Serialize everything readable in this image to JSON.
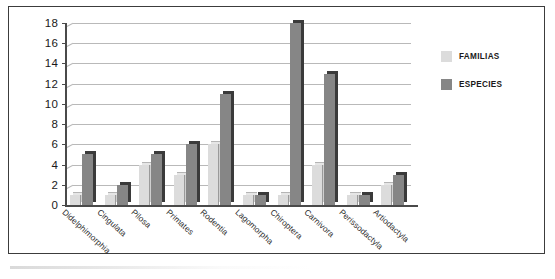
{
  "chart_data": {
    "type": "bar",
    "title": "",
    "xlabel": "",
    "ylabel": "",
    "ylim": [
      0,
      18
    ],
    "ytick_step": 2,
    "yticks": [
      0,
      2,
      4,
      6,
      8,
      10,
      12,
      14,
      16,
      18
    ],
    "grid": true,
    "legend_position": "right",
    "categories": [
      "Didelphimorphia",
      "Cingulata",
      "Pilosa",
      "Primates",
      "Rodentia",
      "Lagomorpha",
      "Chiroptera",
      "Carnivora",
      "Perissodactyla",
      "Artiodactyla"
    ],
    "series": [
      {
        "name": "FAMILIAS",
        "color": "#dcdcdc",
        "values": [
          1,
          1,
          4,
          3,
          6,
          1,
          1,
          4,
          1,
          2
        ]
      },
      {
        "name": "ESPECIES",
        "color": "#868686",
        "values": [
          5,
          2,
          5,
          6,
          11,
          1,
          18,
          13,
          1,
          3
        ]
      }
    ]
  },
  "legend": {
    "items": [
      {
        "label": "FAMILIAS",
        "color": "#dcdcdc"
      },
      {
        "label": "ESPECIES",
        "color": "#868686"
      }
    ]
  },
  "colors": {
    "familias": "#dcdcdc",
    "especies": "#868686",
    "axis": "#4a4a4a",
    "grid": "#b9b9b9",
    "frame": "#3c3c3c",
    "text": "#1a1a1a"
  }
}
